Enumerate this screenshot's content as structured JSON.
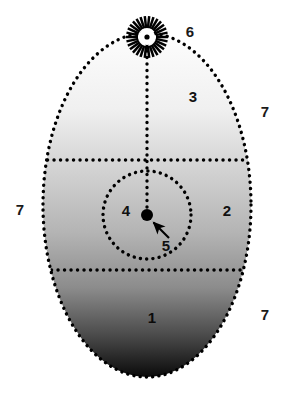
{
  "figure": {
    "background_color": "#ffffff",
    "canvas": {
      "width": 285,
      "height": 397
    }
  },
  "shape": {
    "name": "ovoid-outline",
    "style": "dotted",
    "stroke_color": "#000000",
    "center_x": 147,
    "center_y": 205,
    "radius_x": 104,
    "radius_y": 172,
    "fill_description": "vertical grayscale gradient, white at top to black at bottom",
    "gradient_stops": [
      {
        "offset": "0%",
        "color": "#fdfdfd"
      },
      {
        "offset": "22%",
        "color": "#f0f0f0"
      },
      {
        "offset": "40%",
        "color": "#d2d2d2"
      },
      {
        "offset": "58%",
        "color": "#b4b4b4"
      },
      {
        "offset": "74%",
        "color": "#8c8c8c"
      },
      {
        "offset": "88%",
        "color": "#4a4a4a"
      },
      {
        "offset": "100%",
        "color": "#0a0a0a"
      }
    ]
  },
  "dividers": [
    {
      "name": "upper-horizontal-divider",
      "y": 160,
      "style": "dotted",
      "x_start": 47,
      "x_end": 248
    },
    {
      "name": "lower-horizontal-divider",
      "y": 270,
      "style": "dotted",
      "x_start": 51,
      "x_end": 245
    },
    {
      "name": "vertical-axis-divider",
      "x": 147,
      "y_start": 38,
      "y_end": 216,
      "style": "dotted"
    }
  ],
  "inner_circle": {
    "name": "inner-circle",
    "center_x": 147,
    "center_y": 215,
    "radius": 44,
    "style": "dotted",
    "stroke_color": "#000000"
  },
  "center_point": {
    "name": "center-point-marker",
    "x": 147,
    "y": 215,
    "radius": 6,
    "color": "#000000"
  },
  "burst": {
    "name": "starburst-marker",
    "center_x": 147,
    "center_y": 37,
    "spoke_count": 30,
    "inner_radius": 9,
    "outer_radius": 21,
    "hub_radius": 8,
    "hub_color": "#ffffff",
    "dot_radius": 2.6,
    "dot_color": "#000000",
    "stroke_color": "#000000"
  },
  "arrow": {
    "name": "callout-arrow",
    "from_x": 169,
    "from_y": 238,
    "to_x": 152,
    "to_y": 221,
    "color": "#000000"
  },
  "labels": [
    {
      "id": "label-1",
      "text": "1",
      "x": 152,
      "y": 319,
      "tone": "on-dark"
    },
    {
      "id": "label-2",
      "text": "2",
      "x": 227,
      "y": 212,
      "tone": "normal"
    },
    {
      "id": "label-3",
      "text": "3",
      "x": 193,
      "y": 98,
      "tone": "normal"
    },
    {
      "id": "label-4",
      "text": "4",
      "x": 126,
      "y": 212,
      "tone": "normal"
    },
    {
      "id": "label-5",
      "text": "5",
      "x": 166,
      "y": 247,
      "tone": "normal"
    },
    {
      "id": "label-6",
      "text": "6",
      "x": 190,
      "y": 33,
      "tone": "outside"
    },
    {
      "id": "label-7-right-top",
      "text": "7",
      "x": 265,
      "y": 113,
      "tone": "outside"
    },
    {
      "id": "label-7-left",
      "text": "7",
      "x": 20,
      "y": 211,
      "tone": "outside"
    },
    {
      "id": "label-7-right-bottom",
      "text": "7",
      "x": 265,
      "y": 316,
      "tone": "outside"
    }
  ]
}
